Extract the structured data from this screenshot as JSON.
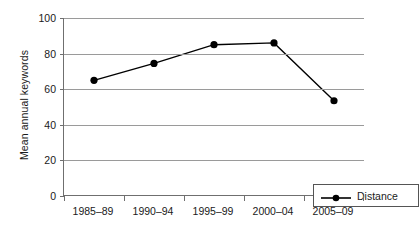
{
  "chart_data": {
    "type": "line",
    "title": "",
    "xlabel": "",
    "ylabel": "Mean annual keywords",
    "categories": [
      "1985–89",
      "1990–94",
      "1995–99",
      "2000–04",
      "2005–09"
    ],
    "series": [
      {
        "name": "Distance",
        "values": [
          65,
          74.5,
          85,
          86,
          53.5
        ],
        "color": "#000000",
        "marker": "filled-circle"
      }
    ],
    "ylim": [
      0,
      100
    ],
    "yticks": [
      0,
      20,
      40,
      60,
      80,
      100
    ],
    "ytick_labels": [
      "0",
      "20",
      "40",
      "60",
      "80",
      "100"
    ],
    "grid": "horizontal",
    "grid_color": "#9a9a9a",
    "axis_color": "#6f6f6f",
    "background": "#ffffff",
    "legend_position": "bottom-right-inside",
    "legend_entries": [
      "Distance"
    ]
  }
}
